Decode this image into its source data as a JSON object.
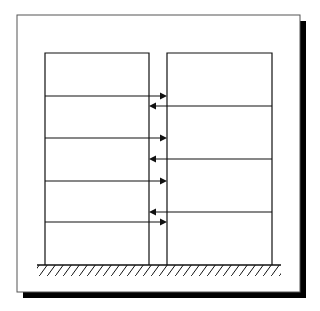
{
  "diagram": {
    "type": "structural-pounding-schematic",
    "frame": {
      "x": 17,
      "y": 15,
      "width": 283,
      "height": 277,
      "shadow_offset": 6
    },
    "ground": {
      "y": 265,
      "x1": 37,
      "x2": 281
    },
    "buildings": [
      {
        "name": "left-building",
        "x": 45,
        "y": 53,
        "width": 104,
        "height": 212,
        "floor_lines": [
          96,
          138,
          181,
          222
        ]
      },
      {
        "name": "right-building",
        "x": 167,
        "y": 53,
        "width": 105,
        "height": 212,
        "floor_lines": [
          106,
          159,
          212
        ]
      }
    ],
    "arrows": [
      {
        "direction": "right",
        "y": 96
      },
      {
        "direction": "left",
        "y": 106
      },
      {
        "direction": "right",
        "y": 138
      },
      {
        "direction": "left",
        "y": 159
      },
      {
        "direction": "right",
        "y": 181
      },
      {
        "direction": "left",
        "y": 212
      },
      {
        "direction": "right",
        "y": 222
      }
    ],
    "colors": {
      "line": "#111111",
      "background": "#ffffff",
      "shadow": "#000000"
    }
  }
}
